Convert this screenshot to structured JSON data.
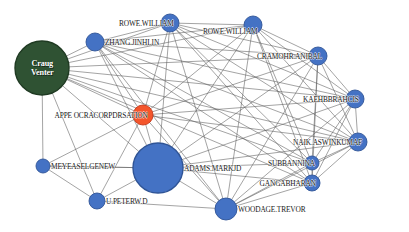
{
  "graph": {
    "title": "Co-authorship / collaboration network",
    "background_color": "#ffffff",
    "edge_color": "#5a5a5a",
    "node_colors": {
      "blue": "#4472c4",
      "blue_stroke": "#2f5496",
      "green": "#2f5233",
      "green_stroke": "#1f3a22",
      "orange": "#f4552b",
      "orange_stroke": "#c4381a"
    },
    "nodes": [
      {
        "id": "craig-venter",
        "label": "Craug\nVenter",
        "label_line1": "Craug",
        "label_line2": "Venter",
        "color": "#2f5233",
        "color_name": "green",
        "x": 42,
        "y": 68,
        "r": 27,
        "label_position": "inside"
      },
      {
        "id": "zhang-jinhlin",
        "label": "ZHANG.JINHLIN",
        "color": "#4472c4",
        "color_name": "blue",
        "x": 95,
        "y": 42,
        "r": 9,
        "label_position": "right"
      },
      {
        "id": "rowe-william-1",
        "label": "ROWE.WILLIAM",
        "color": "#4472c4",
        "color_name": "blue",
        "x": 170,
        "y": 23,
        "r": 9,
        "label_position": "left-center"
      },
      {
        "id": "rowe-william-2",
        "label": "ROWE.WILLIAM",
        "color": "#4472c4",
        "color_name": "blue",
        "x": 253,
        "y": 25,
        "r": 9,
        "label_position": "below-left"
      },
      {
        "id": "cramohr-anibal",
        "label": "CRAMOHR.ANIBAL",
        "color": "#4472c4",
        "color_name": "blue",
        "x": 318,
        "y": 56,
        "r": 9,
        "label_position": "left-center"
      },
      {
        "id": "kaehbbrahcis",
        "label": "KAEHBBRAHCIS",
        "color": "#4472c4",
        "color_name": "blue",
        "x": 355,
        "y": 99,
        "r": 9,
        "label_position": "left-center"
      },
      {
        "id": "naik-aswinkumaf",
        "label": "NAIK.ASWINKUMAF",
        "color": "#4472c4",
        "color_name": "blue",
        "x": 358,
        "y": 142,
        "r": 9,
        "label_position": "left-center"
      },
      {
        "id": "subbannina",
        "label": "SUBBANNINA",
        "color": "#4472c4",
        "color_name": "blue",
        "x": 312,
        "y": 163,
        "r": 7,
        "label_position": "left-center"
      },
      {
        "id": "gangabharan",
        "label": "GANGABHARAN",
        "color": "#4472c4",
        "color_name": "blue",
        "x": 312,
        "y": 183,
        "r": 8,
        "label_position": "left-center"
      },
      {
        "id": "woodage-trevor",
        "label": "WOODAGE.TREVOR",
        "color": "#4472c4",
        "color_name": "blue",
        "x": 226,
        "y": 209,
        "r": 11,
        "label_position": "right"
      },
      {
        "id": "adams-markjd",
        "label": "ADAMS.MARKJD",
        "color": "#4472c4",
        "color_name": "blue",
        "x": 158,
        "y": 168,
        "r": 25,
        "label_position": "right"
      },
      {
        "id": "u-peterw-d",
        "label": "U.PETERW.D",
        "color": "#4472c4",
        "color_name": "blue",
        "x": 97,
        "y": 201,
        "r": 8,
        "label_position": "right"
      },
      {
        "id": "meyeaselgenew",
        "label": "MEYEASELGENEW",
        "color": "#4472c4",
        "color_name": "blue",
        "x": 43,
        "y": 166,
        "r": 7,
        "label_position": "right"
      },
      {
        "id": "apple-oracle-corp",
        "label": "APPE OCRACORPDRSATION",
        "color": "#f4552b",
        "color_name": "orange",
        "x": 143,
        "y": 115,
        "r": 10,
        "label_position": "left-center"
      }
    ],
    "edges": [
      [
        "craig-venter",
        "zhang-jinhlin"
      ],
      [
        "craig-venter",
        "rowe-william-1"
      ],
      [
        "craig-venter",
        "rowe-william-2"
      ],
      [
        "craig-venter",
        "cramohr-anibal"
      ],
      [
        "craig-venter",
        "kaehbbrahcis"
      ],
      [
        "craig-venter",
        "naik-aswinkumaf"
      ],
      [
        "craig-venter",
        "adams-markjd"
      ],
      [
        "craig-venter",
        "apple-oracle-corp"
      ],
      [
        "craig-venter",
        "meyeaselgenew"
      ],
      [
        "craig-venter",
        "u-peterw-d"
      ],
      [
        "craig-venter",
        "subbannina"
      ],
      [
        "craig-venter",
        "gangabharan"
      ],
      [
        "zhang-jinhlin",
        "rowe-william-1"
      ],
      [
        "zhang-jinhlin",
        "rowe-william-2"
      ],
      [
        "zhang-jinhlin",
        "cramohr-anibal"
      ],
      [
        "zhang-jinhlin",
        "kaehbbrahcis"
      ],
      [
        "zhang-jinhlin",
        "naik-aswinkumaf"
      ],
      [
        "zhang-jinhlin",
        "adams-markjd"
      ],
      [
        "zhang-jinhlin",
        "apple-oracle-corp"
      ],
      [
        "zhang-jinhlin",
        "woodage-trevor"
      ],
      [
        "zhang-jinhlin",
        "subbannina"
      ],
      [
        "zhang-jinhlin",
        "gangabharan"
      ],
      [
        "rowe-william-1",
        "rowe-william-2"
      ],
      [
        "rowe-william-1",
        "cramohr-anibal"
      ],
      [
        "rowe-william-1",
        "kaehbbrahcis"
      ],
      [
        "rowe-william-1",
        "naik-aswinkumaf"
      ],
      [
        "rowe-william-1",
        "adams-markjd"
      ],
      [
        "rowe-william-1",
        "apple-oracle-corp"
      ],
      [
        "rowe-william-1",
        "woodage-trevor"
      ],
      [
        "rowe-william-1",
        "subbannina"
      ],
      [
        "rowe-william-1",
        "gangabharan"
      ],
      [
        "rowe-william-2",
        "cramohr-anibal"
      ],
      [
        "rowe-william-2",
        "kaehbbrahcis"
      ],
      [
        "rowe-william-2",
        "naik-aswinkumaf"
      ],
      [
        "rowe-william-2",
        "adams-markjd"
      ],
      [
        "rowe-william-2",
        "apple-oracle-corp"
      ],
      [
        "rowe-william-2",
        "woodage-trevor"
      ],
      [
        "rowe-william-2",
        "subbannina"
      ],
      [
        "rowe-william-2",
        "gangabharan"
      ],
      [
        "cramohr-anibal",
        "kaehbbrahcis"
      ],
      [
        "cramohr-anibal",
        "naik-aswinkumaf"
      ],
      [
        "cramohr-anibal",
        "adams-markjd"
      ],
      [
        "cramohr-anibal",
        "apple-oracle-corp"
      ],
      [
        "cramohr-anibal",
        "woodage-trevor"
      ],
      [
        "cramohr-anibal",
        "subbannina"
      ],
      [
        "cramohr-anibal",
        "gangabharan"
      ],
      [
        "kaehbbrahcis",
        "naik-aswinkumaf"
      ],
      [
        "kaehbbrahcis",
        "adams-markjd"
      ],
      [
        "kaehbbrahcis",
        "apple-oracle-corp"
      ],
      [
        "kaehbbrahcis",
        "woodage-trevor"
      ],
      [
        "kaehbbrahcis",
        "subbannina"
      ],
      [
        "kaehbbrahcis",
        "gangabharan"
      ],
      [
        "naik-aswinkumaf",
        "adams-markjd"
      ],
      [
        "naik-aswinkumaf",
        "apple-oracle-corp"
      ],
      [
        "naik-aswinkumaf",
        "woodage-trevor"
      ],
      [
        "naik-aswinkumaf",
        "subbannina"
      ],
      [
        "naik-aswinkumaf",
        "gangabharan"
      ],
      [
        "subbannina",
        "gangabharan"
      ],
      [
        "subbannina",
        "woodage-trevor"
      ],
      [
        "subbannina",
        "adams-markjd"
      ],
      [
        "gangabharan",
        "woodage-trevor"
      ],
      [
        "gangabharan",
        "adams-markjd"
      ],
      [
        "woodage-trevor",
        "adams-markjd"
      ],
      [
        "woodage-trevor",
        "apple-oracle-corp"
      ],
      [
        "woodage-trevor",
        "u-peterw-d"
      ],
      [
        "adams-markjd",
        "apple-oracle-corp"
      ],
      [
        "adams-markjd",
        "u-peterw-d"
      ],
      [
        "adams-markjd",
        "meyeaselgenew"
      ],
      [
        "apple-oracle-corp",
        "u-peterw-d"
      ],
      [
        "apple-oracle-corp",
        "meyeaselgenew"
      ],
      [
        "meyeaselgenew",
        "u-peterw-d"
      ],
      [
        "meyeaselgenew",
        "adams-markjd"
      ]
    ]
  }
}
